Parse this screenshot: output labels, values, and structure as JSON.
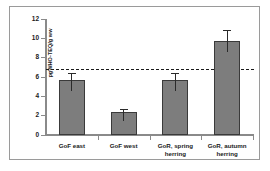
{
  "chart_data": {
    "type": "bar",
    "title": "",
    "subtitle": "",
    "xlabel": "",
    "ylabel": "pgWHO-TEQ/g ww",
    "categories": [
      "GoF east",
      "GoF west",
      "GoR, spring herring",
      "GoR, autumn herring"
    ],
    "values": [
      5.7,
      2.4,
      5.7,
      9.7
    ],
    "errors_low": [
      1.1,
      1.0,
      1.1,
      1.1
    ],
    "errors_high": [
      0.7,
      0.3,
      0.7,
      1.2
    ],
    "ylim": [
      0,
      12
    ],
    "yticks": [
      0,
      2,
      4,
      6,
      8,
      10,
      12
    ],
    "ytick_labels": [
      "0",
      "2",
      "4",
      "6",
      "8",
      "10",
      "12"
    ],
    "grid": false,
    "legend": false,
    "legend_position": "none",
    "bar_color": "#7d7d7d",
    "bar_edge_color": "#3a3a3a",
    "reference_line": {
      "value": 6.8,
      "style": "dashed",
      "color": "#1a1a1a"
    }
  },
  "axis": {
    "color": "#8a8a8a"
  },
  "frame": {
    "border_color": "#9a9a9a"
  }
}
